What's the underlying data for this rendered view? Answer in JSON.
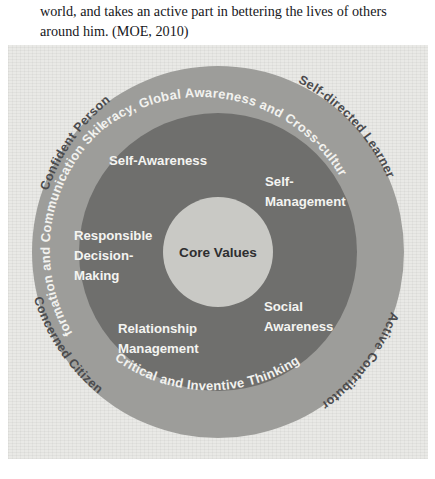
{
  "page_text": {
    "line1": "world, and takes an active part in bettering the lives of others",
    "line2": "around him. (MOE, 2010)"
  },
  "figure": {
    "name": "moe-21st-century-competencies-framework",
    "core": {
      "label": "Core Values"
    },
    "middle_ring": {
      "name": "social-emotional-competencies-ring",
      "items": [
        {
          "id": "self-awareness",
          "label": "Self-Awareness"
        },
        {
          "id": "self-management",
          "line1": "Self-",
          "line2": "Management"
        },
        {
          "id": "social-awareness",
          "line1": "Social",
          "line2": "Awareness"
        },
        {
          "id": "relationship-management",
          "line1": "Relationship",
          "line2": "Management"
        },
        {
          "id": "responsible-decision-making",
          "line1": "Responsible",
          "line2": "Decision-",
          "line3": "Making"
        }
      ]
    },
    "outer_ring": {
      "name": "emerging-21cc-ring",
      "items": [
        {
          "id": "civic-literacy",
          "label": "Civic Literacy, Global Awareness and Cross-cultural Skills"
        },
        {
          "id": "critical-inventive-thinking",
          "label": "Critical and Inventive Thinking"
        },
        {
          "id": "information-communication-skills",
          "label": "Information and Communication Skills"
        }
      ]
    },
    "outcomes": {
      "name": "desired-outcomes-of-education",
      "items": [
        {
          "id": "confident-person",
          "label": "Confident Person"
        },
        {
          "id": "self-directed-learner",
          "label": "Self-directed Learner"
        },
        {
          "id": "active-contributor",
          "label": "Active Contributor"
        },
        {
          "id": "concerned-citizen",
          "label": "Concerned Citizen"
        }
      ]
    },
    "colors": {
      "background": "#e9e9e6",
      "ring_outer": "#9d9d9a",
      "ring_middle": "#6f6f6d",
      "ring_core": "#c9c9c5",
      "ring_label_text": "#f2f2ef",
      "outer_label_text": "#4b4b4d",
      "core_label_text": "#2e2e30"
    }
  }
}
